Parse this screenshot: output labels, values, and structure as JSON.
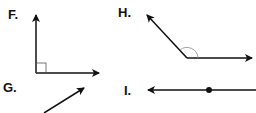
{
  "figures": [
    {
      "label": "F.",
      "kind": "right-angle",
      "description": "Right angle formed by two rays from a common vertex, with a square right-angle marker",
      "vertex": [
        36,
        73
      ],
      "rays": [
        [
          36,
          15
        ],
        [
          99,
          73
        ]
      ],
      "marker": "square"
    },
    {
      "label": "G.",
      "kind": "ray",
      "description": "Single ray pointing up and to the right",
      "start": [
        44,
        113
      ],
      "end": [
        84,
        88
      ]
    },
    {
      "label": "H.",
      "kind": "obtuse-angle",
      "description": "Obtuse angle formed by two rays from a common vertex, with an arc marker",
      "vertex": [
        187,
        58
      ],
      "rays": [
        [
          147,
          15
        ],
        [
          252,
          58
        ]
      ],
      "marker": "arc"
    },
    {
      "label": "I.",
      "kind": "ray-with-point",
      "description": "Horizontal ray pointing left with a marked endpoint-like point on the line",
      "start": [
        256,
        90
      ],
      "end": [
        148,
        90
      ],
      "point": [
        209,
        90
      ]
    }
  ],
  "colors": {
    "stroke": "#111111",
    "marker": "#888888",
    "background": "#ffffff"
  }
}
